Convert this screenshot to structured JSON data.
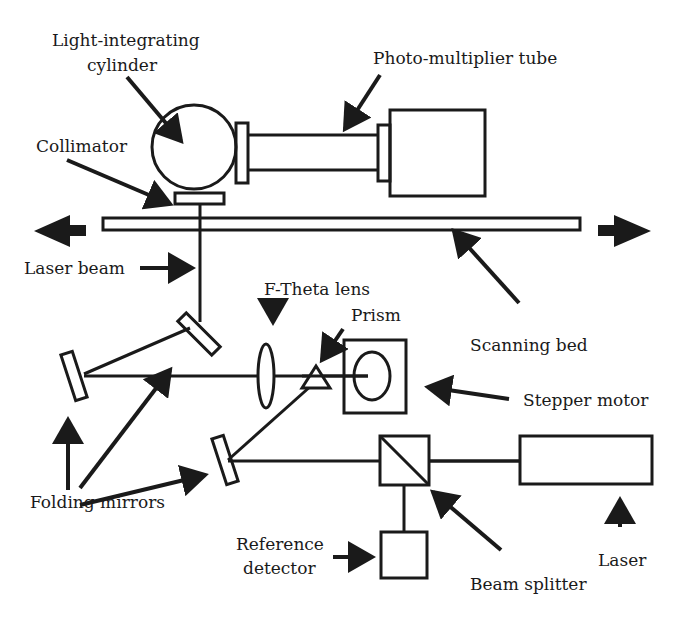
{
  "diagram": {
    "type": "optical-schematic",
    "labels": {
      "light_integrating_cylinder_1": "Light-integrating",
      "light_integrating_cylinder_2": "cylinder",
      "photo_multiplier_tube": "Photo-multiplier tube",
      "collimator": "Collimator",
      "laser_beam": "Laser beam",
      "f_theta_lens": "F-Theta lens",
      "prism": "Prism",
      "scanning_bed": "Scanning bed",
      "stepper_motor": "Stepper motor",
      "folding_mirrors": "Folding mirrors",
      "reference_detector_1": "Reference",
      "reference_detector_2": "detector",
      "beam_splitter": "Beam splitter",
      "laser": "Laser"
    },
    "components": [
      "Light-integrating cylinder",
      "Photo-multiplier tube",
      "Collimator",
      "Scanning bed",
      "Laser beam",
      "Folding mirrors",
      "F-Theta lens",
      "Prism",
      "Stepper motor",
      "Beam splitter",
      "Reference detector",
      "Laser"
    ],
    "colors": {
      "ink": "#1a1a1a",
      "background": "#ffffff"
    }
  }
}
